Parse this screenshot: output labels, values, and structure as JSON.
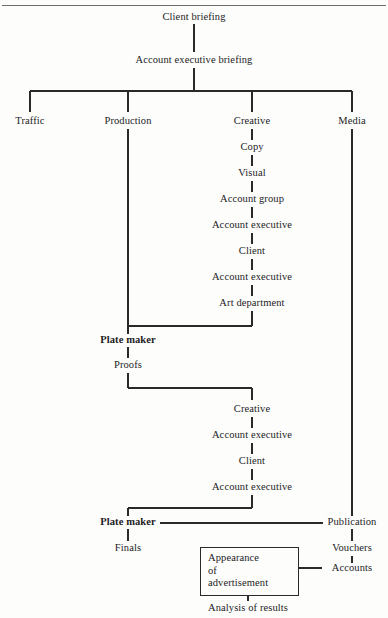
{
  "diagram": {
    "type": "flowchart",
    "line_color": "#2a2a2a",
    "rule_color": "#6d6d6d",
    "text_color": "#1c1c1c",
    "top_rule": true,
    "nodes": {
      "client_briefing": "Client briefing",
      "account_executive_briefing": "Account executive briefing",
      "traffic": "Traffic",
      "production": "Production",
      "creative": "Creative",
      "media": "Media",
      "copy": "Copy",
      "visual": "Visual",
      "account_group": "Account group",
      "account_executive_1": "Account executive",
      "client_1": "Client",
      "account_executive_2": "Account executive",
      "art_department": "Art department",
      "plate_maker_1": "Plate maker",
      "proofs": "Proofs",
      "creative_2": "Creative",
      "account_executive_3": "Account executive",
      "client_2": "Client",
      "account_executive_4": "Account executive",
      "plate_maker_2": "Plate maker",
      "finals": "Finals",
      "publication": "Publication",
      "vouchers": "Vouchers",
      "accounts": "Accounts",
      "appearance_line_1": "Appearance",
      "appearance_line_2": "of",
      "appearance_line_3": "advertisement",
      "analysis_of_results": "Analysis of results"
    }
  }
}
